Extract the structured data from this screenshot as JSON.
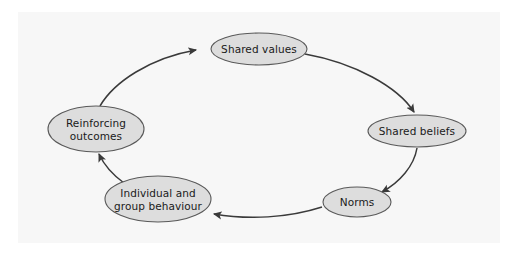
{
  "diagram": {
    "type": "cycle-flow",
    "direction": "clockwise",
    "colors": {
      "page_background": "#ffffff",
      "panel_background": "#f7f7f7",
      "node_fill": "#dddddd",
      "node_stroke": "#595959",
      "edge_stroke": "#3a3a3a",
      "label_text": "#1a1a1a"
    },
    "panel": {
      "x": 18,
      "y": 12,
      "width": 482,
      "height": 231
    },
    "nodes": [
      {
        "id": "shared-values",
        "label": "Shared values",
        "lines": [
          "Shared values"
        ],
        "cx": 259,
        "cy": 49,
        "rx": 48,
        "ry": 16
      },
      {
        "id": "shared-beliefs",
        "label": "Shared beliefs",
        "lines": [
          "Shared beliefs"
        ],
        "cx": 417,
        "cy": 131,
        "rx": 49,
        "ry": 16
      },
      {
        "id": "norms",
        "label": "Norms",
        "lines": [
          "Norms"
        ],
        "cx": 357,
        "cy": 202,
        "rx": 34,
        "ry": 15
      },
      {
        "id": "individual-and-group-behaviour",
        "label": "Individual and group behaviour",
        "lines": [
          "Individual and",
          "group behaviour"
        ],
        "cx": 158,
        "cy": 199,
        "rx": 53,
        "ry": 23
      },
      {
        "id": "reinforcing-outcomes",
        "label": "Reinforcing outcomes",
        "lines": [
          "Reinforcing",
          "outcomes"
        ],
        "cx": 96,
        "cy": 129,
        "rx": 48,
        "ry": 23
      }
    ],
    "edges": [
      {
        "id": "edge-values-to-beliefs",
        "from": "shared-values",
        "to": "shared-beliefs",
        "arrow": "to"
      },
      {
        "id": "edge-beliefs-to-norms",
        "from": "shared-beliefs",
        "to": "norms",
        "arrow": "to"
      },
      {
        "id": "edge-norms-to-behaviour",
        "from": "norms",
        "to": "individual-and-group-behaviour",
        "arrow": "to"
      },
      {
        "id": "edge-behaviour-to-outcomes",
        "from": "individual-and-group-behaviour",
        "to": "reinforcing-outcomes",
        "arrow": "to"
      },
      {
        "id": "edge-outcomes-to-values",
        "from": "reinforcing-outcomes",
        "to": "shared-values",
        "arrow": "to"
      }
    ]
  }
}
